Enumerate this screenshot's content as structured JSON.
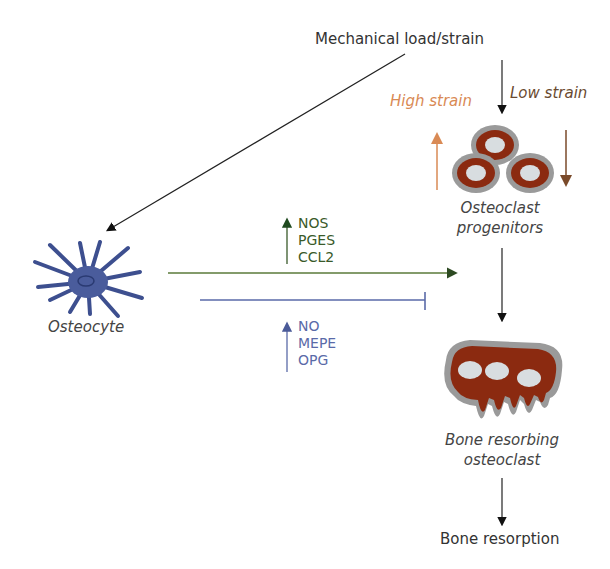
{
  "diagram": {
    "top_label": "Mechanical load/strain",
    "high_strain": "High strain",
    "low_strain": "Low strain",
    "osteocyte": "Osteocyte",
    "progenitors_line1": "Osteoclast",
    "progenitors_line2": "progenitors",
    "upregulated": [
      "NOS",
      "PGES",
      "CCL2"
    ],
    "downregulated": [
      "NO",
      "MEPE",
      "OPG"
    ],
    "resorbing_line1": "Bone resorbing",
    "resorbing_line2": "osteoclast",
    "bottom_label": "Bone resorption"
  },
  "colors": {
    "high_strain": "#d98a55",
    "low_strain": "#7a4a2a",
    "up_arrow": "#3a5a2a",
    "down_arrow": "#5a6aa8",
    "osteocyte": "#3d4f8f",
    "osteoclast": "#8b2a10",
    "grey_rim": "#a0a0a0"
  }
}
